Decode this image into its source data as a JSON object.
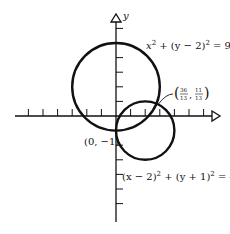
{
  "diagram": {
    "type": "coordinate-plane-circles",
    "axes": {
      "x_label": "",
      "y_label": "y",
      "origin_px": [
        116,
        116
      ],
      "unit_px": 14.6,
      "x_ticks": [
        -6,
        -5,
        -4,
        -3,
        -2,
        -1,
        1,
        2,
        3,
        4,
        5,
        6
      ],
      "y_ticks": [
        -7,
        -6,
        -5,
        -4,
        -3,
        -2,
        -1,
        1,
        2,
        3,
        4,
        5,
        6
      ]
    },
    "circles": [
      {
        "name": "circle-1",
        "center": [
          0,
          2
        ],
        "radius": 3,
        "equation": "x² + (y − 2)² = 9"
      },
      {
        "name": "circle-2",
        "center": [
          2,
          -1
        ],
        "radius": 2,
        "equation": "(x − 2)² + (y + 1)² = 4"
      }
    ],
    "intersection_points": [
      {
        "label": "(0, −1)",
        "x": 0,
        "y": -1
      },
      {
        "label": "(36/13, 11/13)",
        "x_num": "36",
        "x_den": "13",
        "y_num": "11",
        "y_den": "13"
      }
    ],
    "labels": {
      "eq1_a": "x",
      "eq1_b": "2",
      "eq1_c": " + (y − 2)",
      "eq1_d": "2",
      "eq1_e": " = 9",
      "eq2_a": "(x − 2)",
      "eq2_b": "2",
      "eq2_c": " + (y + 1)",
      "eq2_d": "2",
      "eq2_e": " = 4",
      "point1": "(0, −1)",
      "point2_open": "(",
      "point2_close": ")",
      "point2_comma": ",",
      "point2_xnum": "36",
      "point2_xden": "13",
      "point2_ynum": "11",
      "point2_yden": "13"
    }
  }
}
